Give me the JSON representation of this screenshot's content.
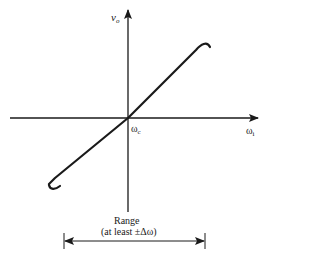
{
  "diagram": {
    "type": "transfer-characteristic",
    "y_axis": {
      "label_main": "v",
      "label_sub": "o"
    },
    "x_axis": {
      "label_main": "ω",
      "label_sub": "i"
    },
    "origin_label": {
      "main": "ω",
      "sub": "c"
    },
    "range": {
      "title": "Range",
      "subtitle": "(at least ±Δω)"
    },
    "colors": {
      "line": "#1a1a1a",
      "background": "#ffffff"
    }
  }
}
